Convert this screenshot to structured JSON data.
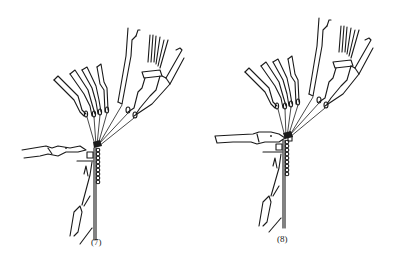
{
  "figure": {
    "panels": [
      {
        "id": "7",
        "caption": "(7)",
        "sinker_position": "retracted"
      },
      {
        "id": "8",
        "caption": "(8)",
        "sinker_position": "extended"
      }
    ]
  },
  "colors": {
    "line": "#1a1a1a",
    "background": "#ffffff"
  }
}
